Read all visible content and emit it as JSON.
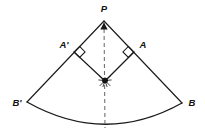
{
  "figure": {
    "background_color": "#ffffff",
    "line_color": "#1a1a1a",
    "dashed_color": "#6b6b6b"
  },
  "labels": {
    "apex": "P",
    "right_foot": "A",
    "left_foot": "A'",
    "right_arc_end": "B",
    "left_arc_end": "B'"
  },
  "points": {
    "P": {
      "label": "P",
      "x": 104,
      "y": 21
    },
    "A": {
      "label": "A",
      "x": 134,
      "y": 52
    },
    "A_prime": {
      "label": "A'",
      "x": 74,
      "y": 52
    },
    "N": {
      "label": "",
      "x": 105,
      "y": 81
    },
    "B": {
      "label": "B",
      "x": 182,
      "y": 103
    },
    "B_prime": {
      "label": "B'",
      "x": 27,
      "y": 102
    },
    "arc_bottom": {
      "label": "",
      "x": 105,
      "y": 128
    }
  },
  "label_positions": {
    "P": {
      "x": 104,
      "y": 9
    },
    "A": {
      "x": 143,
      "y": 45
    },
    "A_prime": {
      "x": 64,
      "y": 45
    },
    "B": {
      "x": 192,
      "y": 103
    },
    "B_prime": {
      "x": 17,
      "y": 103
    }
  },
  "segments": [
    {
      "name": "radius-P-to-B-prime",
      "from": "P",
      "to": "B_prime",
      "style": "solid"
    },
    {
      "name": "radius-P-to-B",
      "from": "P",
      "to": "B",
      "style": "solid"
    },
    {
      "name": "side-A-prime-to-N",
      "from": "A_prime",
      "to": "N",
      "style": "solid"
    },
    {
      "name": "side-A-to-N",
      "from": "A",
      "to": "N",
      "style": "solid"
    },
    {
      "name": "axis-P-to-arc",
      "from": "P",
      "to": "arc_bottom",
      "style": "dashed"
    }
  ],
  "arc": {
    "name": "outer-arc-B-prime-to-B",
    "from": "B_prime",
    "to": "B",
    "bulge_direction": "down",
    "lowest_point_y": 128
  },
  "right_angle_marks": [
    {
      "name": "right-angle-at-A",
      "at": "A",
      "size": 8
    },
    {
      "name": "right-angle-at-A-prime",
      "at": "A_prime",
      "size": 8
    }
  ],
  "markers": {
    "arrowhead_at_apex": {
      "name": "up-arrowhead-below-P",
      "x": 104,
      "y": 26,
      "direction": "up"
    },
    "starburst_at_center": {
      "name": "starburst-node-N",
      "x": 105,
      "y": 81,
      "rays": 8
    }
  }
}
